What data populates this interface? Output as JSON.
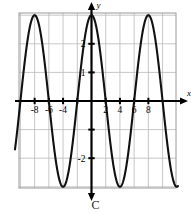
{
  "figure": {
    "caption": "C",
    "axis_labels": {
      "x": "x",
      "y": "y"
    },
    "x_tick_labels": [
      "-8",
      "-6",
      "-4",
      "2",
      "4",
      "6",
      "8"
    ],
    "y_tick_labels": [
      "2",
      "1",
      "-2"
    ],
    "colors": {
      "grid": "#b9b9b9",
      "frame": "#9a9a9a",
      "axis": "#000000",
      "curve": "#111111",
      "background": "#ffffff"
    }
  },
  "chart_data": {
    "type": "line",
    "title": "",
    "subtitle": "",
    "xlabel": "x",
    "ylabel": "y",
    "grid": true,
    "legend": null,
    "xlim": [
      -10,
      10
    ],
    "ylim": [
      -3.3,
      3.3
    ],
    "x_ticks": [
      -8,
      -6,
      -4,
      -2,
      2,
      4,
      6,
      8
    ],
    "x_tick_labels": [
      "-8",
      "-6",
      "-4",
      "",
      "2",
      "4",
      "6",
      "8"
    ],
    "y_ticks": [
      2,
      1,
      -1,
      -2
    ],
    "y_tick_labels": [
      "2",
      "1",
      "",
      "-2"
    ],
    "series": [
      {
        "name": "y = 3 cos(pi x / 4)",
        "function": "cosine",
        "amplitude": 3,
        "period": 8,
        "phase": 0,
        "vertical_shift": 0,
        "maxima_x": [
          -8,
          0,
          8
        ],
        "minima_x": [
          -4,
          4
        ],
        "zeros_x": [
          -10,
          -6,
          -2,
          2,
          6,
          10
        ],
        "x": [
          -10,
          -9.5,
          -9,
          -8.5,
          -8,
          -7.5,
          -7,
          -6.5,
          -6,
          -5.5,
          -5,
          -4.5,
          -4,
          -3.5,
          -3,
          -2.5,
          -2,
          -1.5,
          -1,
          -0.5,
          0,
          0.5,
          1,
          1.5,
          2,
          2.5,
          3,
          3.5,
          4,
          4.5,
          5,
          5.5,
          6,
          6.5,
          7,
          7.5,
          8,
          8.5,
          9,
          9.5,
          10
        ],
        "y": [
          0,
          1.148,
          2.121,
          2.772,
          3,
          2.772,
          2.121,
          1.148,
          0,
          -1.148,
          -2.121,
          -2.772,
          -3,
          -2.772,
          -2.121,
          -1.148,
          0,
          1.148,
          2.121,
          2.772,
          3,
          2.772,
          2.121,
          1.148,
          0,
          -1.148,
          -2.121,
          -2.772,
          -3,
          -2.772,
          -2.121,
          -1.148,
          0,
          1.148,
          2.121,
          2.772,
          3,
          2.772,
          2.121,
          1.148,
          0
        ]
      }
    ]
  }
}
